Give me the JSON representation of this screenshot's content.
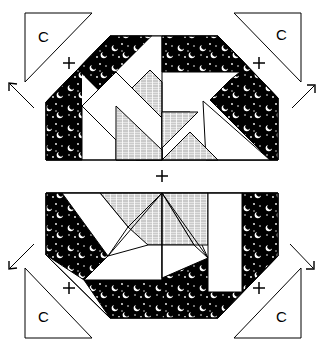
{
  "diagram": {
    "type": "quilt-block-assembly",
    "colors": {
      "dark_fabric": "#000000",
      "light_fabric": "#ffffff",
      "shirting_fabric": "#d8d8d8",
      "outline": "#000000"
    },
    "corner_triangles": [
      {
        "position": "top-left",
        "label": "C"
      },
      {
        "position": "top-right",
        "label": "C"
      },
      {
        "position": "bottom-left",
        "label": "C"
      },
      {
        "position": "bottom-right",
        "label": "C"
      }
    ],
    "join_markers": [
      {
        "position": "top-left",
        "symbol": "+"
      },
      {
        "position": "top-right",
        "symbol": "+"
      },
      {
        "position": "center",
        "symbol": "+"
      },
      {
        "position": "bottom-left",
        "symbol": "+"
      },
      {
        "position": "bottom-right",
        "symbol": "+"
      }
    ],
    "blocks": [
      {
        "name": "top-half-block",
        "fabric_pieces": [
          "dark-moon-star",
          "white",
          "gray-shirting"
        ]
      },
      {
        "name": "bottom-half-block",
        "fabric_pieces": [
          "dark-moon-star",
          "white",
          "gray-shirting"
        ]
      }
    ]
  }
}
